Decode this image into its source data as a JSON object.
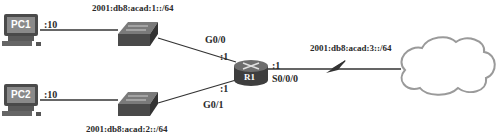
{
  "nodes": {
    "pc1": {
      "label": "PC1",
      "host_id": ":10"
    },
    "pc2": {
      "label": "PC2",
      "host_id": ":10"
    },
    "switch1": {
      "label": ""
    },
    "switch2": {
      "label": ""
    },
    "router": {
      "label": "R1"
    },
    "cloud": {
      "label": ""
    }
  },
  "networks": {
    "lan1": "2001:db8:acad:1::/64",
    "lan2": "2001:db8:acad:2::/64",
    "wan": "2001:db8:acad:3::/64"
  },
  "interfaces": {
    "g00": {
      "name": "G0/0",
      "host_id": ":1"
    },
    "g01": {
      "name": "G0/1",
      "host_id": ":1"
    },
    "s000": {
      "name": "S0/0/0",
      "host_id": ":1"
    }
  },
  "colors": {
    "line": "#333333",
    "device": "#5a5a5a",
    "device_dark": "#3a3a3a",
    "pc_screen": "#8a8a8a",
    "cloud_stroke": "#9a9a9a"
  }
}
